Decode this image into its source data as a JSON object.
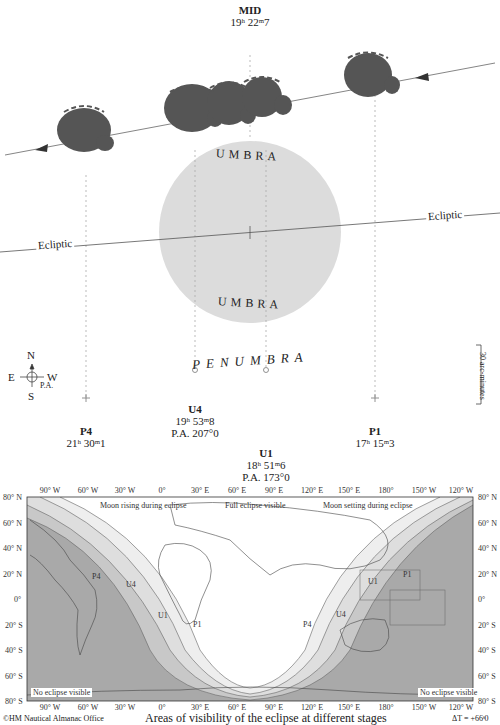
{
  "diagram": {
    "mid": {
      "label": "MID",
      "time": "19ʰ 22ᵐ7"
    },
    "contacts": [
      {
        "id": "P4",
        "label": "P4",
        "time": "21ʰ 30ᵐ1"
      },
      {
        "id": "U4",
        "label": "U4",
        "time": "19ʰ 53ᵐ8",
        "pa": "P.A. 207°0"
      },
      {
        "id": "U1",
        "label": "U1",
        "time": "18ʰ 51ᵐ6",
        "pa": "P.A. 173°0"
      },
      {
        "id": "P1",
        "label": "P1",
        "time": "17ʰ 15ᵐ3"
      }
    ],
    "umbra_top": "UMBRA",
    "umbra_bottom": "UMBRA",
    "penumbra": "PENUMBRA",
    "ecliptic_left": "Ecliptic",
    "ecliptic_right": "Ecliptic",
    "compass": {
      "n": "N",
      "s": "S",
      "e": "E",
      "w": "W",
      "pa": "P.A."
    },
    "scale_label": "30 arc-minutes"
  },
  "map": {
    "x_ticks": [
      "90° W",
      "60° W",
      "30° W",
      "0°",
      "30° E",
      "60° E",
      "90° E",
      "120° E",
      "150° E",
      "180°",
      "150° W",
      "120° W"
    ],
    "y_ticks": [
      "80° N",
      "60° N",
      "40° N",
      "20° N",
      "0°",
      "20° S",
      "40° S",
      "60° S",
      "80° S"
    ],
    "region_labels": {
      "moon_rising": "Moon rising during eclipse",
      "full_visible": "Full eclipse visible",
      "moon_setting": "Moon setting during eclipse",
      "no_eclipse_left": "No eclipse visible",
      "no_eclipse_right": "No eclipse visible"
    },
    "band_labels": {
      "p4_left": "P4",
      "u4_left": "U4",
      "u1_left": "U1",
      "p1_center": "P1",
      "p4_center": "P4",
      "u4_right": "U4",
      "u1_right": "U1",
      "p1_right": "P1"
    },
    "title": "Areas of visibility of the eclipse at different stages",
    "credit": "©HM Nautical Almanac Office",
    "delta_t": "ΔT = +66ˢ0"
  },
  "colors": {
    "umbra": "#dcdcdc",
    "moon": "#555555",
    "band_dark": "#a9a9a9",
    "band_mid": "#c8c8c8",
    "band_light": "#e6e6e6"
  }
}
